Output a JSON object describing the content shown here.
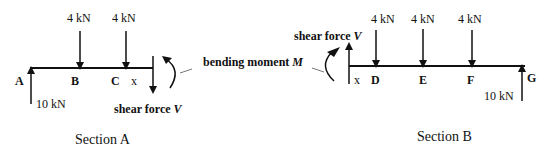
{
  "section_a": {
    "caption": "Section A",
    "loads": [
      {
        "label": "4 kN"
      },
      {
        "label": "4 kN"
      }
    ],
    "points": {
      "A": "A",
      "B": "B",
      "C": "C",
      "x": "x"
    },
    "reaction": "10 kN",
    "shear_label": "shear force ",
    "shear_symbol": "V"
  },
  "bending_moment": {
    "label": "bending moment ",
    "symbol": "M"
  },
  "section_b": {
    "caption": "Section B",
    "loads": [
      {
        "label": "4 kN"
      },
      {
        "label": "4 kN"
      },
      {
        "label": "4 kN"
      }
    ],
    "points": {
      "D": "D",
      "E": "E",
      "F": "F",
      "G": "G",
      "x": "x"
    },
    "reaction": "10 kN",
    "shear_label": "shear force ",
    "shear_symbol": "V"
  }
}
